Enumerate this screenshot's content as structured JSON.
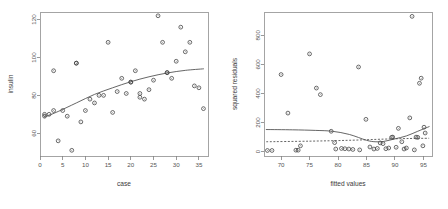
{
  "figure": {
    "background_color": "#ffffff",
    "point_color": "#3b3b3b",
    "line_color": "#4a4a4a",
    "axis_color": "#808080",
    "panel_count": 2
  },
  "chart_data": [
    {
      "type": "scatter",
      "panel": "left",
      "title": "",
      "xlabel": "case",
      "ylabel": "insulin",
      "xlim": [
        0,
        37
      ],
      "ylim": [
        48,
        124
      ],
      "grid": false,
      "legend": null,
      "xticks": [
        0,
        5,
        10,
        15,
        20,
        25,
        30,
        35
      ],
      "yticks": [
        60,
        80,
        100,
        120
      ],
      "marker": "open-circle",
      "x": [
        1,
        1,
        2,
        3,
        3,
        4,
        5,
        6,
        7,
        8,
        8,
        9,
        10,
        11,
        12,
        13,
        14,
        15,
        16,
        17,
        18,
        19,
        20,
        20,
        21,
        22,
        22,
        23,
        24,
        25,
        26,
        27,
        28,
        28,
        29,
        30,
        31,
        32,
        33,
        34,
        35,
        36
      ],
      "y": [
        69,
        70,
        70,
        72,
        93,
        56,
        72,
        69,
        51,
        97,
        97,
        66,
        72,
        78,
        76,
        80,
        80,
        108,
        71,
        82,
        89,
        81,
        87,
        87,
        93,
        81,
        79,
        78,
        83,
        88,
        122,
        108,
        92,
        92,
        89,
        98,
        116,
        103,
        108,
        85,
        84,
        73
      ],
      "fitted_curve": {
        "style": "solid",
        "description": "smooth increasing concave lowess fit",
        "x": [
          1,
          4,
          8,
          12,
          16,
          20,
          24,
          28,
          32,
          36
        ],
        "y": [
          68.5,
          71.5,
          76.0,
          80.5,
          84.0,
          87.2,
          89.8,
          91.8,
          93.2,
          94.0
        ]
      }
    },
    {
      "type": "scatter",
      "panel": "right",
      "title": "",
      "xlabel": "fitted values",
      "ylabel": "squared residuals",
      "xlim": [
        67,
        96.5
      ],
      "ylim": [
        -30,
        960
      ],
      "grid": false,
      "legend": null,
      "xticks": [
        70,
        75,
        80,
        85,
        90,
        95
      ],
      "yticks": [
        0,
        200,
        400,
        600,
        800
      ],
      "marker": "open-circle",
      "x": [
        67.6,
        68.4,
        70.0,
        71.2,
        72.6,
        73.0,
        73.4,
        75.0,
        76.2,
        76.9,
        78.8,
        79.4,
        79.6,
        80.6,
        81.2,
        81.9,
        82.6,
        83.6,
        83.8,
        84.9,
        85.6,
        86.3,
        86.9,
        87.4,
        87.9,
        88.4,
        88.9,
        89.4,
        89.6,
        90.2,
        90.6,
        91.2,
        91.6,
        92.0,
        92.6,
        93.0,
        93.4,
        93.7,
        94.0,
        94.3,
        94.6,
        94.9,
        95.1,
        95.3
      ],
      "y": [
        8,
        8,
        530,
        265,
        10,
        10,
        40,
        672,
        437,
        392,
        140,
        62,
        18,
        22,
        20,
        18,
        15,
        582,
        12,
        222,
        32,
        18,
        22,
        60,
        55,
        20,
        25,
        98,
        100,
        30,
        160,
        68,
        18,
        25,
        232,
        930,
        12,
        100,
        98,
        470,
        505,
        40,
        168,
        128
      ],
      "fitted_curves": [
        {
          "name": "loess fit",
          "style": "solid",
          "x": [
            67.4,
            72,
            76,
            79,
            82,
            85,
            86.5,
            88,
            90,
            92,
            94,
            96
          ],
          "y": [
            152,
            150,
            146,
            140,
            118,
            78,
            68,
            70,
            88,
            108,
            140,
            172
          ]
        },
        {
          "name": "reference level",
          "style": "dashed",
          "x": [
            67.4,
            75,
            82,
            88,
            92,
            96
          ],
          "y": [
            68,
            72,
            78,
            86,
            90,
            92
          ]
        }
      ]
    }
  ]
}
